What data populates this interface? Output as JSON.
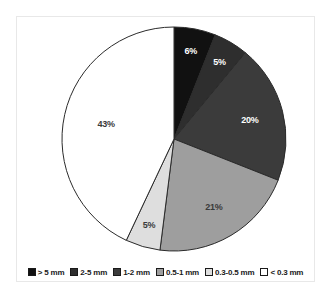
{
  "chart_data": {
    "type": "pie",
    "title": "",
    "categories": [
      "> 5 mm",
      "2-5 mm",
      "1-2 mm",
      "0.5-1 mm",
      "0.3-0.5 mm",
      "< 0.3 mm"
    ],
    "values": [
      6,
      5,
      20,
      21,
      5,
      43
    ],
    "value_unit": "%",
    "data_labels": [
      "6%",
      "5%",
      "20%",
      "21%",
      "5%",
      "43%"
    ],
    "colors": [
      "#111111",
      "#2e2e2e",
      "#3b3b3b",
      "#9e9e9e",
      "#dedede",
      "#ffffff"
    ],
    "label_colors": [
      "#ffffff",
      "#ffffff",
      "#ffffff",
      "#3a3a3a",
      "#3a3a3a",
      "#3a3a3a"
    ],
    "start_angle_deg": 0,
    "direction": "clockwise",
    "slice_outline": "#2b2b2b",
    "legend_position": "bottom",
    "legend": [
      {
        "label": "> 5 mm",
        "color": "#111111"
      },
      {
        "label": "2-5 mm",
        "color": "#2e2e2e"
      },
      {
        "label": "1-2 mm",
        "color": "#3b3b3b"
      },
      {
        "label": "0.5-1 mm",
        "color": "#9e9e9e"
      },
      {
        "label": "0.3-0.5 mm",
        "color": "#dedede"
      },
      {
        "label": "< 0.3 mm",
        "color": "#ffffff"
      }
    ],
    "geometry": {
      "cx": 174,
      "cy": 139,
      "r": 112
    }
  }
}
